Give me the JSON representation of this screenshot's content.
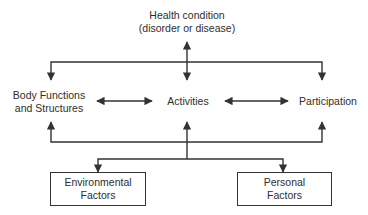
{
  "diagram": {
    "nodes": {
      "health_condition": {
        "line1": "Health condition",
        "line2": "(disorder or disease)"
      },
      "body_functions": {
        "line1": "Body Functions",
        "line2": "and Structures"
      },
      "activities": {
        "label": "Activities"
      },
      "participation": {
        "label": "Participation"
      },
      "environmental": {
        "line1": "Environmental",
        "line2": "Factors"
      },
      "personal": {
        "line1": "Personal",
        "line2": "Factors"
      }
    },
    "edges": [
      {
        "from": "health_condition",
        "to": "activities",
        "type": "bidirectional"
      },
      {
        "from": "health_condition",
        "to": "body_functions",
        "type": "directed"
      },
      {
        "from": "health_condition",
        "to": "participation",
        "type": "directed"
      },
      {
        "from": "body_functions",
        "to": "activities",
        "type": "bidirectional"
      },
      {
        "from": "activities",
        "to": "participation",
        "type": "bidirectional"
      },
      {
        "from": "environmental",
        "to": "body_functions",
        "type": "bidirectional"
      },
      {
        "from": "personal",
        "to": "participation",
        "type": "bidirectional"
      }
    ],
    "colors": {
      "line": "#333333",
      "text": "#2e2e2e",
      "background": "#ffffff"
    }
  }
}
